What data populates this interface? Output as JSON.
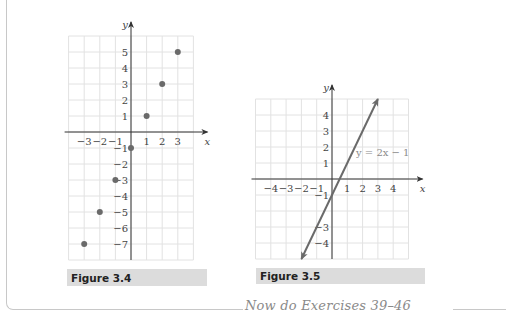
{
  "figures": [
    {
      "caption": "Figure 3.4",
      "axis_labels": {
        "x": "x",
        "y": "y"
      },
      "x_ticks": [
        "−3",
        "−2",
        "−1",
        "1",
        "2",
        "3"
      ],
      "y_ticks": [
        "5",
        "4",
        "3",
        "2",
        "1",
        "−1",
        "−2",
        "−3",
        "−4",
        "−5",
        "−6",
        "−7"
      ]
    },
    {
      "caption": "Figure 3.5",
      "axis_labels": {
        "x": "x",
        "y": "y"
      },
      "x_ticks": [
        "−4",
        "−3",
        "−2",
        "−1",
        "1",
        "2",
        "3",
        "4"
      ],
      "y_ticks": [
        "4",
        "3",
        "2",
        "1",
        "−1",
        "−3",
        "−4"
      ],
      "equation_label": "y = 2x − 1"
    }
  ],
  "footer_note": "Now do Exercises 39–46",
  "chart_data": [
    {
      "type": "scatter",
      "title": "Figure 3.4",
      "xlabel": "x",
      "ylabel": "y",
      "xlim": [
        -4,
        4
      ],
      "ylim": [
        -8,
        6
      ],
      "grid": true,
      "points": [
        {
          "x": -3,
          "y": -7
        },
        {
          "x": -2,
          "y": -5
        },
        {
          "x": -1,
          "y": -3
        },
        {
          "x": 0,
          "y": -1
        },
        {
          "x": 1,
          "y": 1
        },
        {
          "x": 2,
          "y": 3
        },
        {
          "x": 3,
          "y": 5
        }
      ],
      "x_tick_labels": [
        -3,
        -2,
        -1,
        1,
        2,
        3
      ],
      "y_tick_labels": [
        5,
        4,
        3,
        2,
        1,
        -1,
        -2,
        -3,
        -4,
        -5,
        -6,
        -7
      ]
    },
    {
      "type": "line",
      "title": "Figure 3.5",
      "xlabel": "x",
      "ylabel": "y",
      "xlim": [
        -5,
        5
      ],
      "ylim": [
        -5,
        5
      ],
      "grid": true,
      "series": [
        {
          "name": "y = 2x − 1",
          "x": [
            -2,
            3
          ],
          "y": [
            -5,
            5
          ],
          "arrows": "both"
        }
      ],
      "annotations": [
        {
          "text": "y = 2x − 1",
          "x": 2,
          "y": 2
        }
      ],
      "x_tick_labels": [
        -4,
        -3,
        -2,
        -1,
        1,
        2,
        3,
        4
      ],
      "y_tick_labels": [
        4,
        3,
        2,
        1,
        -1,
        -3,
        -4
      ]
    }
  ]
}
